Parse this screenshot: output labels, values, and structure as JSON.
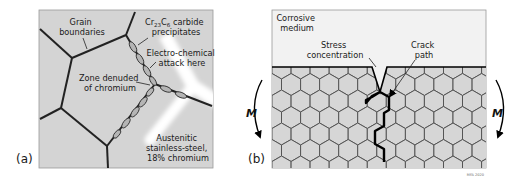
{
  "figure": {
    "panel_a": {
      "label": "(a)",
      "annotations": {
        "grain_boundaries": [
          "Grain",
          "boundaries"
        ],
        "carbide": {
          "prefix": "Cr",
          "sub1": "23",
          "mid": "C",
          "sub2": "6",
          "suffix": " carbide",
          "line2": "precipitates"
        },
        "attack": [
          "Electro-chemical",
          "attack here"
        ],
        "zone": [
          "Zone denuded",
          "of chromium"
        ],
        "material": [
          "Austenitic",
          "stainless-steel,",
          "18% chromium"
        ]
      },
      "colors": {
        "background": "#d4d4d4",
        "boundary": "#222222",
        "denuded_zone": "#ffffff",
        "precipitate": "#b5b5b5"
      }
    },
    "panel_b": {
      "label": "(b)",
      "annotations": {
        "medium": [
          "Corrosive",
          "medium"
        ],
        "stress": [
          "Stress",
          "concentration"
        ],
        "crack": [
          "Crack",
          "path"
        ],
        "moment_left": "M",
        "moment_right": "M"
      },
      "credit": "MFA 2020",
      "colors": {
        "medium": "#f2f2f2",
        "grain": "#d6d6d6",
        "grain_edge": "#555555",
        "crack": "#000000"
      }
    }
  }
}
